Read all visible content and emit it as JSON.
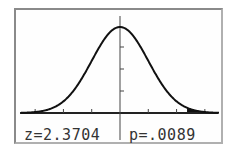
{
  "chart_data": {
    "type": "area",
    "title": "",
    "xlabel": "",
    "ylabel": "",
    "xlim": [
      -3.5,
      3.5
    ],
    "x_ticks": [
      -3,
      -2,
      -1,
      0,
      1,
      2,
      3
    ],
    "y_ticks_count": 3,
    "shaded_region": {
      "from": 2.3704,
      "to": 3.5,
      "side": "right"
    },
    "grid": false,
    "legend": null
  },
  "readouts": {
    "z_label": "z=2.3704",
    "p_label": "p=.0089"
  },
  "colors": {
    "curve": "#111111",
    "shade": "#111111",
    "frame": "#8a8a8a",
    "text": "#333333"
  }
}
